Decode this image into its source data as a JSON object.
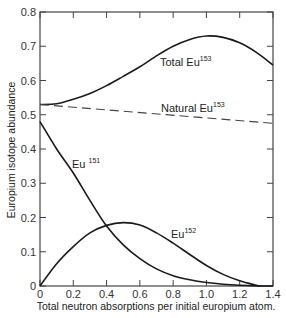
{
  "chart_data": {
    "type": "line",
    "title": "",
    "xlabel": "Total neutron absorptions per initial europium atom.",
    "ylabel": "Europium isotope abundance",
    "xlim": [
      0,
      1.4
    ],
    "ylim": [
      0,
      0.8
    ],
    "grid": false,
    "legend": "inline labels",
    "x_ticks": [
      "0",
      "0.2",
      "0.4",
      "0.6",
      "0.8",
      "1.0",
      "1.2",
      "1.4"
    ],
    "y_ticks": [
      "0",
      "0.1",
      "0.2",
      "0.3",
      "0.4",
      "0.5",
      "0.6",
      "0.7",
      "0.8"
    ],
    "series": [
      {
        "name": "Total Eu153",
        "label_base": "Total Eu",
        "label_sup": "153",
        "style": "solid",
        "x": [
          0,
          0.1,
          0.2,
          0.3,
          0.4,
          0.5,
          0.6,
          0.7,
          0.8,
          0.9,
          1.0,
          1.1,
          1.2,
          1.3,
          1.4
        ],
        "values": [
          0.53,
          0.532,
          0.545,
          0.562,
          0.585,
          0.612,
          0.64,
          0.672,
          0.7,
          0.72,
          0.73,
          0.726,
          0.71,
          0.682,
          0.645
        ]
      },
      {
        "name": "Natural Eu153",
        "label_base": "Natural Eu",
        "label_sup": "153",
        "style": "dashed",
        "x": [
          0,
          1.4
        ],
        "values": [
          0.53,
          0.475
        ]
      },
      {
        "name": "Eu151",
        "label_base": "Eu",
        "label_sup": "151",
        "style": "solid",
        "x": [
          0,
          0.1,
          0.2,
          0.3,
          0.4,
          0.5,
          0.6,
          0.7,
          0.8,
          0.9,
          1.0,
          1.1,
          1.2,
          1.3,
          1.4
        ],
        "values": [
          0.48,
          0.4,
          0.33,
          0.25,
          0.175,
          0.12,
          0.08,
          0.05,
          0.03,
          0.018,
          0.01,
          0.005,
          0.002,
          0.0005,
          0
        ]
      },
      {
        "name": "Eu152",
        "label_base": "Eu",
        "label_sup": "152",
        "style": "solid",
        "x": [
          0,
          0.1,
          0.2,
          0.3,
          0.4,
          0.5,
          0.6,
          0.7,
          0.8,
          0.9,
          1.0,
          1.1,
          1.2,
          1.3,
          1.32
        ],
        "values": [
          0,
          0.065,
          0.115,
          0.155,
          0.177,
          0.185,
          0.178,
          0.155,
          0.125,
          0.092,
          0.06,
          0.034,
          0.015,
          0.002,
          0
        ]
      }
    ]
  }
}
